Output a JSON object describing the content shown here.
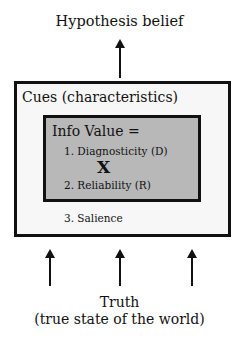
{
  "diagram": {
    "top_label": "Hypothesis belief",
    "outer_box": {
      "title": "Cues (characteristics)",
      "background": "#f7f7f7"
    },
    "inner_box": {
      "title": "Info Value =",
      "item1": "1. Diagnosticity (D)",
      "operator": "X",
      "item2": "2. Reliability (R)",
      "background": "#b8b8b8"
    },
    "outer_item3": "3. Salience",
    "bottom_label_line1": "Truth",
    "bottom_label_line2": "(true state of the world)",
    "arrows": {
      "top_count": 1,
      "bottom_count": 3
    }
  }
}
